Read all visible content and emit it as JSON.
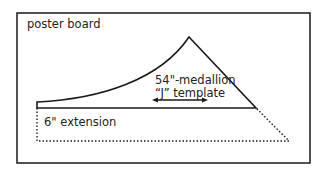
{
  "labels": {
    "poster_board": "poster board",
    "template_line1": "54\"-medallion",
    "template_line2": "“J” template",
    "extension": "6\" extension"
  },
  "colors": {
    "stroke": "#1a1a1a",
    "text": "#222222",
    "background": "#ffffff"
  }
}
